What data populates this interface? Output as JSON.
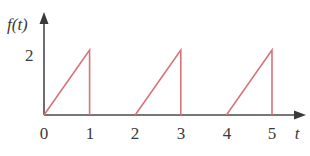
{
  "chart_data": {
    "type": "line",
    "title": "",
    "xlabel": "t",
    "ylabel": "f(t)",
    "x_ticks": [
      "0",
      "1",
      "2",
      "3",
      "4",
      "5"
    ],
    "y_ticks": [
      "2"
    ],
    "xlim": [
      0,
      5.7
    ],
    "ylim": [
      0,
      2.5
    ],
    "grid": false,
    "legend": null,
    "series": [
      {
        "name": "f(t)",
        "color": "#d9737a",
        "segments": [
          {
            "x": [
              0,
              1,
              1
            ],
            "y": [
              0,
              2,
              0
            ]
          },
          {
            "x": [
              2,
              3,
              3
            ],
            "y": [
              0,
              2,
              0
            ]
          },
          {
            "x": [
              4,
              5,
              5
            ],
            "y": [
              0,
              2,
              0
            ]
          }
        ]
      }
    ],
    "axis_color": "#4a4a4a"
  }
}
